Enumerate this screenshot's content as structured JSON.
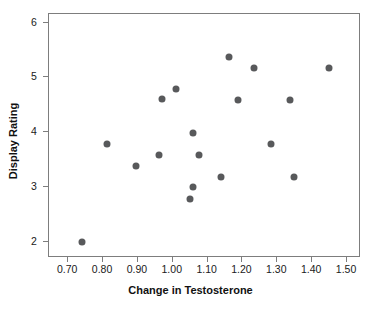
{
  "chart_data": {
    "type": "scatter",
    "title": "",
    "xlabel": "Change in Testosterone",
    "ylabel": "Display Rating",
    "xlim": [
      0.645,
      1.54
    ],
    "ylim": [
      1.7,
      6.16
    ],
    "xticks": [
      0.7,
      0.8,
      0.9,
      1.0,
      1.1,
      1.2,
      1.3,
      1.4,
      1.5
    ],
    "xticklabels": [
      "0.70",
      "0.80",
      "0.90",
      "1.00",
      "1.10",
      "1.20",
      "1.30",
      "1.40",
      "1.50"
    ],
    "yticks": [
      2,
      3,
      4,
      5,
      6
    ],
    "yticklabels": [
      "2",
      "3",
      "4",
      "5",
      "6"
    ],
    "grid": false,
    "legend": false,
    "marker_color": "#58595b",
    "marker_size": 7,
    "points": [
      {
        "x": 0.74,
        "y": 2.0
      },
      {
        "x": 0.81,
        "y": 3.78
      },
      {
        "x": 0.895,
        "y": 3.38
      },
      {
        "x": 0.96,
        "y": 3.58
      },
      {
        "x": 0.968,
        "y": 4.6
      },
      {
        "x": 1.008,
        "y": 4.78
      },
      {
        "x": 1.05,
        "y": 2.78
      },
      {
        "x": 1.058,
        "y": 2.99
      },
      {
        "x": 1.058,
        "y": 3.98
      },
      {
        "x": 1.075,
        "y": 3.58
      },
      {
        "x": 1.138,
        "y": 3.18
      },
      {
        "x": 1.162,
        "y": 5.37
      },
      {
        "x": 1.186,
        "y": 4.58
      },
      {
        "x": 1.232,
        "y": 5.17
      },
      {
        "x": 1.283,
        "y": 3.78
      },
      {
        "x": 1.335,
        "y": 4.58
      },
      {
        "x": 1.348,
        "y": 3.18
      },
      {
        "x": 1.447,
        "y": 5.17
      }
    ]
  },
  "axes": {
    "xlabel": "Change in Testosterone",
    "ylabel": "Display Rating"
  }
}
